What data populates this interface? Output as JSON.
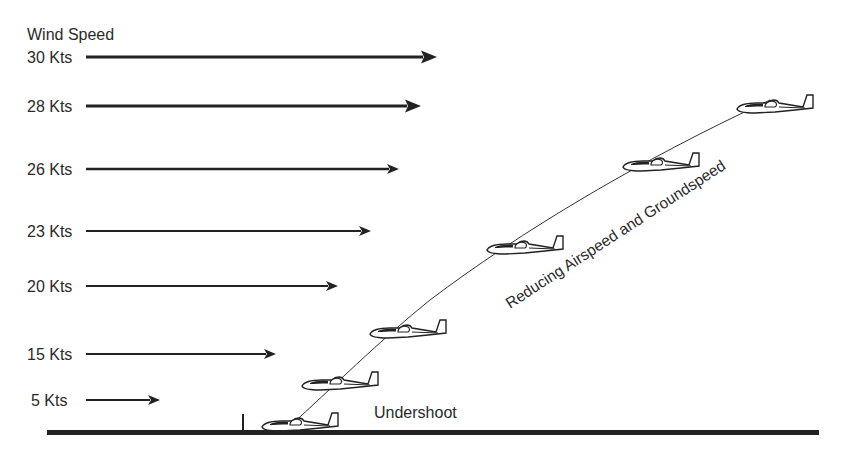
{
  "title": "Wind Speed",
  "unit_suffix": "Kts",
  "wind_gradient": [
    {
      "label": "30 Kts",
      "speed": 30
    },
    {
      "label": "28 Kts",
      "speed": 28
    },
    {
      "label": "26 Kts",
      "speed": 26
    },
    {
      "label": "23 Kts",
      "speed": 23
    },
    {
      "label": "20 Kts",
      "speed": 20
    },
    {
      "label": "15 Kts",
      "speed": 15
    },
    {
      "label": "5 Kts",
      "speed": 5
    }
  ],
  "glider_count": 6,
  "annotations": {
    "path_label": "Reducing Airspeed and Groundspeed",
    "ground_label": "Undershoot"
  },
  "colors": {
    "ink": "#222222",
    "background": "#ffffff"
  }
}
